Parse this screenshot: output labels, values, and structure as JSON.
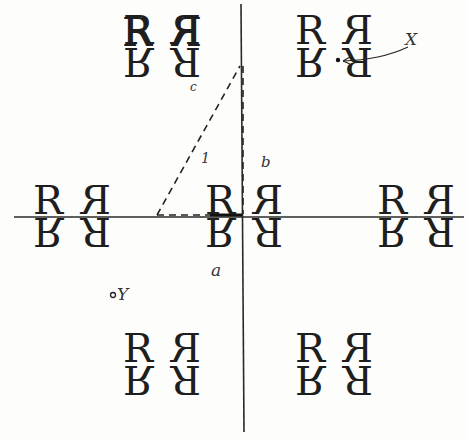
{
  "diagram": {
    "motif_glyph": "R",
    "motifs": [
      {
        "id": "top-left",
        "x": 162,
        "y": 46
      },
      {
        "id": "top-right",
        "x": 334,
        "y": 46
      },
      {
        "id": "mid-left",
        "x": 72,
        "y": 216
      },
      {
        "id": "center",
        "x": 244,
        "y": 216
      },
      {
        "id": "mid-right",
        "x": 416,
        "y": 216
      },
      {
        "id": "bottom-left",
        "x": 162,
        "y": 364
      },
      {
        "id": "bottom-right",
        "x": 334,
        "y": 364
      }
    ],
    "labels": {
      "c": "c",
      "one": "1",
      "b": "b",
      "a": "a",
      "X": "X",
      "Y": "Y"
    },
    "axes": {
      "horizontal_y": 217,
      "vertical_x": 241
    },
    "colors": {
      "ink": "#1e1e1e",
      "paper": "#fdfdfb"
    }
  }
}
